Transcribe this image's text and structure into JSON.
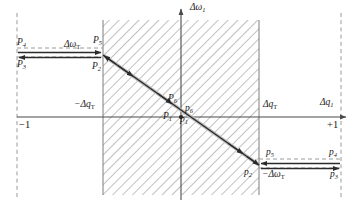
{
  "figure": {
    "axes": {
      "vertical_label": "Δω",
      "vertical_sub": "1",
      "horizontal_label": "Δq",
      "horizontal_sub": "1",
      "left_tick": "−1",
      "right_tick": "+1",
      "neg_threshold_q": "−Δq",
      "neg_threshold_q_sub": "T",
      "pos_threshold_q": "Δq",
      "pos_threshold_q_sub": "T",
      "pos_threshold_w": "Δω",
      "pos_threshold_w_sub": "T",
      "neg_threshold_w": "−Δω",
      "neg_threshold_w_sub": "T"
    },
    "points_upper": [
      {
        "name": "P",
        "sub": "4"
      },
      {
        "name": "P",
        "sub": "3"
      },
      {
        "name": "P",
        "sub": "5"
      },
      {
        "name": "P",
        "sub": "2"
      },
      {
        "name": "P",
        "sub": "6"
      },
      {
        "name": "P",
        "sub": "1"
      }
    ],
    "points_lower": [
      {
        "name": "p",
        "sub": "6"
      },
      {
        "name": "p",
        "sub": "1"
      },
      {
        "name": "p",
        "sub": "2"
      },
      {
        "name": "p",
        "sub": "5"
      },
      {
        "name": "p",
        "sub": "4"
      },
      {
        "name": "p",
        "sub": "3"
      }
    ],
    "colors": {
      "axis": "#4a4a4a",
      "dashed": "#9a9a9a",
      "hatch": "#8c8c8c",
      "trajectory": "#2b2b2b",
      "text": "#1a1a1a"
    },
    "labels": {
      "P4": "P",
      "P4s": "4",
      "P3": "P",
      "P3s": "3",
      "P5": "P",
      "P5s": "5",
      "P2": "P",
      "P2s": "2",
      "P6": "P",
      "P6s": "6",
      "P1": "P",
      "P1s": "1",
      "p6": "p",
      "p6s": "6",
      "p1": "p",
      "p1s": "1",
      "p2": "p",
      "p2s": "2",
      "p5": "p",
      "p5s": "5",
      "p4": "p",
      "p4s": "4",
      "p3": "p",
      "p3s": "3"
    }
  }
}
